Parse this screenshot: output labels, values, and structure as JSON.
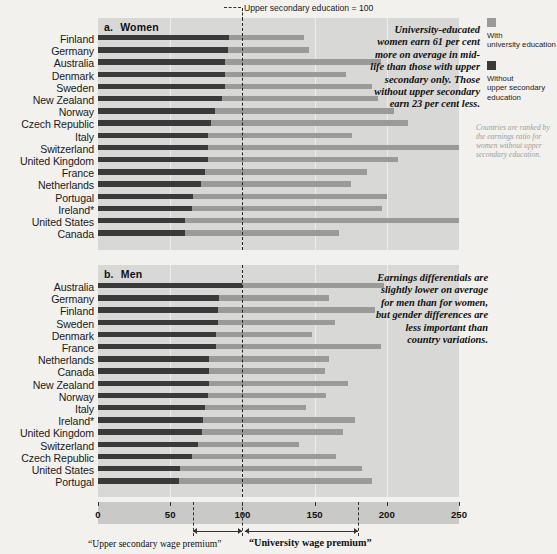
{
  "figure": {
    "top_caption": "Upper secondary education = 100",
    "axis": {
      "min": 0,
      "max": 250,
      "ticks": [
        0,
        50,
        100,
        150,
        200,
        250
      ],
      "reference_line": 100
    },
    "legend": [
      {
        "label_line1": "With",
        "label_line2": "university education",
        "color": "#9a9a98",
        "name": "with-university-education"
      },
      {
        "label_line1": "Without",
        "label_line2": "upper secondary",
        "label_line3": "education",
        "color": "#3a3a3a",
        "name": "without-upper-secondary-education"
      }
    ],
    "rank_note": "Countries are ranked by the earnings ratio for women without upper secondary education.",
    "premium_labels": {
      "upper_secondary": "“Upper secondary wage premium”",
      "university": "“University wage premium”"
    }
  },
  "chart_data": [
    {
      "type": "bar",
      "id": "women",
      "panel_letter": "a.",
      "title": "Women",
      "orientation": "horizontal",
      "xlabel": "",
      "ylabel": "",
      "xlim": [
        0,
        250
      ],
      "reference": 100,
      "grid": false,
      "annotation": "University-educated women earn 61 per cent more on average in mid-life than those with upper secondary only. Those without upper secondary earn 23 per cent less.",
      "categories": [
        "Finland",
        "Germany",
        "Australia",
        "Denmark",
        "Sweden",
        "New Zealand",
        "Norway",
        "Czech Republic",
        "Italy",
        "Switzerland",
        "United Kingdom",
        "France",
        "Netherlands",
        "Portugal",
        "Ireland*",
        "United States",
        "Canada"
      ],
      "series": [
        {
          "name": "With university education",
          "color": "#9a9a98",
          "values": [
            143,
            146,
            196,
            172,
            190,
            194,
            205,
            215,
            176,
            250,
            208,
            186,
            175,
            200,
            197,
            250,
            167
          ]
        },
        {
          "name": "Without upper secondary education",
          "color": "#3a3a3a",
          "values": [
            91,
            90,
            88,
            88,
            88,
            86,
            81,
            78,
            76,
            76,
            76,
            74,
            71,
            66,
            65,
            60,
            60
          ]
        }
      ]
    },
    {
      "type": "bar",
      "id": "men",
      "panel_letter": "b.",
      "title": "Men",
      "orientation": "horizontal",
      "xlabel": "",
      "ylabel": "",
      "xlim": [
        0,
        250
      ],
      "reference": 100,
      "grid": false,
      "annotation": "Earnings differentials are slightly lower on average for men than for women, but gender differences are less important than country variations.",
      "categories": [
        "Australia",
        "Germany",
        "Finland",
        "Sweden",
        "Denmark",
        "France",
        "Netherlands",
        "Canada",
        "New Zealand",
        "Norway",
        "Italy",
        "Ireland*",
        "United Kingdom",
        "Switzerland",
        "Czech Republic",
        "United States",
        "Portugal"
      ],
      "series": [
        {
          "name": "With university education",
          "color": "#9a9a98",
          "values": [
            198,
            160,
            192,
            164,
            148,
            196,
            160,
            157,
            173,
            158,
            144,
            178,
            170,
            139,
            165,
            183,
            190
          ]
        },
        {
          "name": "Without upper secondary education",
          "color": "#3a3a3a",
          "values": [
            100,
            84,
            83,
            83,
            82,
            82,
            77,
            77,
            77,
            76,
            74,
            73,
            72,
            69,
            65,
            57,
            56
          ]
        }
      ]
    }
  ]
}
